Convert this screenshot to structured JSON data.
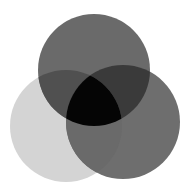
{
  "diagram": {
    "type": "venn-3",
    "background": "#ffffff",
    "circles": [
      {
        "id": "top",
        "cx": 94,
        "cy": 70,
        "r": 56,
        "color": "#6a6a6a"
      },
      {
        "id": "left",
        "cx": 66,
        "cy": 126,
        "r": 56,
        "color": "#d4d4d4"
      },
      {
        "id": "right",
        "cx": 123,
        "cy": 122,
        "r": 57,
        "color": "#6e6e6e"
      }
    ],
    "overlaps": {
      "top_left": "#505050",
      "top_right": "#3a3a3a",
      "left_right": "#6a6a6a",
      "all": "#050505"
    }
  }
}
